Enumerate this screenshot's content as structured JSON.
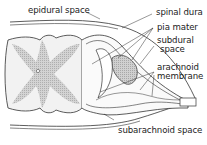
{
  "diagram": {
    "labels": {
      "epidural_space": "epidural space",
      "spinal_dura": "spinal dura",
      "pia_mater": "pia mater",
      "subdural_space_line1": "subdural",
      "subdural_space_line2": "space",
      "arachnoid_membrane_line1": "arachnoid",
      "arachnoid_membrane_line2": "membrane",
      "subarachnoid_space": "subarachnoid space"
    },
    "colors": {
      "line": "#333333",
      "gray_matter": "#bdbdbd",
      "white_matter": "#f2f2f2",
      "ganglion": "#9a9a9a",
      "background": "#ffffff",
      "text": "#222222"
    }
  }
}
